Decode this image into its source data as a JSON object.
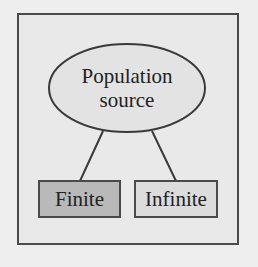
{
  "diagram": {
    "root": {
      "line1": "Population",
      "line2": "source",
      "shape": "ellipse"
    },
    "children": [
      {
        "label": "Finite",
        "fill": "#b9b9b9",
        "shape": "rectangle"
      },
      {
        "label": "Infinite",
        "fill": "#dcdcdc",
        "shape": "rectangle"
      }
    ],
    "colors": {
      "background": "#eeeeee",
      "frame_fill": "#e9e9e9",
      "stroke": "#4a4a4a"
    }
  }
}
